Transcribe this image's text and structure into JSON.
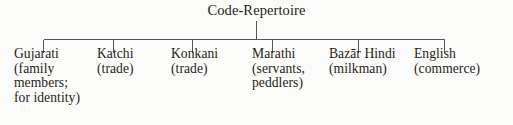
{
  "diagram": {
    "type": "tree",
    "orientation": "top-down",
    "root": {
      "label": "Code-Repertoire"
    },
    "children": [
      {
        "name": "gujarati",
        "lines": [
          "Gujarati",
          "(family",
          "members;",
          "for identity)"
        ]
      },
      {
        "name": "katchi",
        "lines": [
          "Katchi",
          "(trade)"
        ]
      },
      {
        "name": "konkani",
        "lines": [
          "Konkani",
          "(trade)"
        ]
      },
      {
        "name": "marathi",
        "lines": [
          "Marathi",
          "(servants,",
          "peddlers)"
        ]
      },
      {
        "name": "bazar-hindi",
        "lines": [
          "Bazār Hindi",
          "(milkman)"
        ]
      },
      {
        "name": "english",
        "lines": [
          "English",
          "(commerce)"
        ]
      }
    ],
    "colors": {
      "background": "#fbfbf9",
      "text": "#1e1e20",
      "connector": "#55565a"
    }
  }
}
